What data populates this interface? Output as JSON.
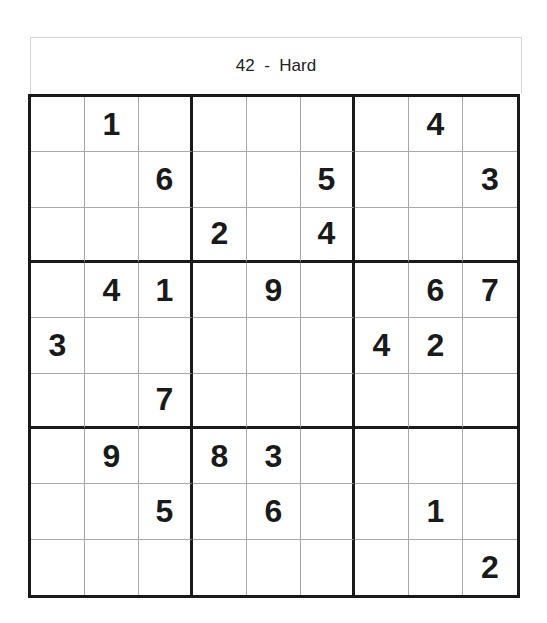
{
  "header": {
    "puzzle_number": "42",
    "separator": "-",
    "difficulty": "Hard"
  },
  "grid": [
    [
      "",
      "1",
      "",
      "",
      "",
      "",
      "",
      "4",
      ""
    ],
    [
      "",
      "",
      "6",
      "",
      "",
      "5",
      "",
      "",
      "3"
    ],
    [
      "",
      "",
      "",
      "2",
      "",
      "4",
      "",
      "",
      ""
    ],
    [
      "",
      "4",
      "1",
      "",
      "9",
      "",
      "",
      "6",
      "7"
    ],
    [
      "3",
      "",
      "",
      "",
      "",
      "",
      "4",
      "2",
      ""
    ],
    [
      "",
      "",
      "7",
      "",
      "",
      "",
      "",
      "",
      ""
    ],
    [
      "",
      "9",
      "",
      "8",
      "3",
      "",
      "",
      "",
      ""
    ],
    [
      "",
      "",
      "5",
      "",
      "6",
      "",
      "",
      "1",
      ""
    ],
    [
      "",
      "",
      "",
      "",
      "",
      "",
      "",
      "",
      "2"
    ]
  ]
}
